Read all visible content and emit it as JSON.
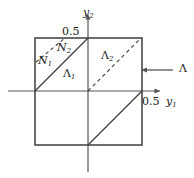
{
  "figure": {
    "background_color": "#ffffff",
    "line_color": "#3c3c3c",
    "axis_color": "#555555",
    "labels": {
      "axis_y2": "y",
      "axis_y2_sub": "2",
      "axis_y1": "y",
      "axis_y1_sub": "1",
      "tick_y2": "0.5",
      "tick_y1": "0.5",
      "region_N1": "N",
      "region_N1_sub": "1",
      "region_N2": "N",
      "region_N2_sub": "2",
      "region_Lambda1": "Λ",
      "region_Lambda1_sub": "1",
      "region_Lambda2": "Λ",
      "region_Lambda2_sub": "2",
      "callout_Lambda": "Λ"
    },
    "geometry": {
      "square": {
        "left": 35,
        "top": 38,
        "right": 142,
        "bottom": 145
      },
      "origin": {
        "x": 88,
        "y": 91
      },
      "x_axis": {
        "x_start": 8,
        "x_end": 162,
        "y": 91
      },
      "y_axis": {
        "y_start": 14,
        "y_end": 172,
        "x": 88
      },
      "solid_diagonals": [
        {
          "from": [
            35,
            91
          ],
          "to": [
            88,
            38
          ]
        },
        {
          "from": [
            88,
            145
          ],
          "to": [
            142,
            91
          ]
        }
      ],
      "dashed_diagonals": [
        {
          "from": [
            35,
            62
          ],
          "to": [
            64,
            38
          ]
        },
        {
          "from": [
            88,
            91
          ],
          "to": [
            142,
            38
          ]
        }
      ],
      "callout_arrow": {
        "from": [
          172,
          70
        ],
        "to": [
          142,
          70
        ]
      }
    }
  }
}
